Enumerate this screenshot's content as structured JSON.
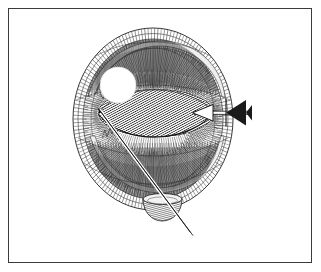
{
  "image": {
    "kind": "pen-and-ink anatomical illustration",
    "subject": "eye globe sectioned, showing lens, instrument and probe",
    "background_color": "#ffffff",
    "ink_color": "#1a1a1a"
  },
  "frame": {
    "border_color": "#3b3b3f",
    "border_width_px": 1.4,
    "x": 8,
    "y": 8,
    "width": 304,
    "height": 255,
    "fill": "#ffffff"
  },
  "figure": {
    "globe": {
      "name": "eye-globe",
      "center_x": 153,
      "center_y": 119,
      "radius_x": 80,
      "radius_y": 91,
      "outline_color": "#2a2a2a"
    },
    "inner_shell": {
      "name": "inner-shell",
      "center_x": 153,
      "center_y": 119,
      "radius_x": 70,
      "radius_y": 80
    },
    "lens": {
      "name": "lens-body",
      "center_x": 156,
      "center_y": 113,
      "radius_x": 58,
      "radius_y": 24,
      "fill_tone": "#5a5a5a",
      "hatch_angle_deg": 62
    },
    "highlight": {
      "name": "specular-highlight",
      "center_x": 118,
      "center_y": 85,
      "radius": 18,
      "fill": "#ffffff"
    },
    "arrow": {
      "name": "pointer-arrow",
      "shaft_x1": 196,
      "shaft_x2": 252,
      "shaft_y": 113,
      "head_tip_x": 193,
      "tail_flare_x": 249
    },
    "probe": {
      "name": "probe-needle",
      "x1": 99,
      "y1": 110,
      "x2": 191,
      "y2": 234,
      "width_px": 3.4
    },
    "optic_cup": {
      "name": "optic-nerve-cup",
      "center_x": 162,
      "center_y": 208,
      "radius_x": 19,
      "radius_y": 12,
      "fill_tone": "#707070"
    },
    "hatching": {
      "radial_lines": 150,
      "lens_hatch_lines": 86,
      "shell_hatch_lines": 120,
      "line_color": "#242424"
    }
  },
  "labels": {
    "none_visible": ""
  }
}
